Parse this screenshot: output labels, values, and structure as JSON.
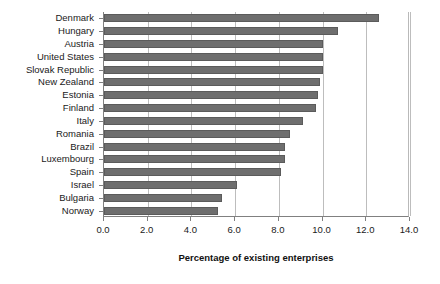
{
  "chart_data": {
    "type": "bar",
    "orientation": "horizontal",
    "title": "",
    "xlabel": "Percentage of existing enterprises",
    "ylabel": "",
    "xlim": [
      0.0,
      14.0
    ],
    "xticks": [
      "0.0",
      "2.0",
      "4.0",
      "6.0",
      "8.0",
      "10.0",
      "12.0",
      "14.0"
    ],
    "xtick_values": [
      0.0,
      2.0,
      4.0,
      6.0,
      8.0,
      10.0,
      12.0,
      14.0
    ],
    "grid": "vertical",
    "legend": "none",
    "bar_color": "#6e6e6e",
    "categories": [
      "Denmark",
      "Hungary",
      "Austria",
      "United States",
      "Slovak Republic",
      "New Zealand",
      "Estonia",
      "Finland",
      "Italy",
      "Romania",
      "Brazil",
      "Luxembourg",
      "Spain",
      "Israel",
      "Bulgaria",
      "Norway"
    ],
    "values": [
      12.6,
      10.7,
      10.0,
      10.0,
      10.0,
      9.9,
      9.8,
      9.7,
      9.1,
      8.5,
      8.3,
      8.3,
      8.1,
      6.1,
      5.4,
      5.2
    ]
  }
}
